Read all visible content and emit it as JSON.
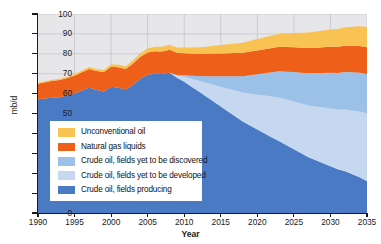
{
  "chart_data": {
    "type": "area",
    "title": "",
    "subtitle": "",
    "xlabel": "Year",
    "ylabel": "mb/d",
    "xlim": [
      1990,
      2035
    ],
    "ylim": [
      0,
      100
    ],
    "xticks": [
      1990,
      1995,
      2000,
      2005,
      2010,
      2015,
      2020,
      2025,
      2030,
      2035
    ],
    "yticks": [
      0,
      10,
      20,
      30,
      40,
      50,
      60,
      70,
      80,
      90,
      100
    ],
    "grid": true,
    "stacked": true,
    "legend_position": "lower-left",
    "x": [
      1990,
      1991,
      1992,
      1993,
      1994,
      1995,
      1996,
      1997,
      1998,
      1999,
      2000,
      2001,
      2002,
      2003,
      2004,
      2005,
      2006,
      2007,
      2008,
      2009,
      2010,
      2011,
      2012,
      2013,
      2014,
      2015,
      2016,
      2017,
      2018,
      2019,
      2020,
      2021,
      2022,
      2023,
      2024,
      2025,
      2026,
      2027,
      2028,
      2029,
      2030,
      2031,
      2032,
      2033,
      2034,
      2035
    ],
    "series": [
      {
        "name": "Crude oil, fields producing",
        "color": "#4a7ac4",
        "values": [
          57.0,
          57.5,
          58.0,
          58.2,
          59.0,
          60.0,
          61.5,
          63.0,
          61.8,
          61.0,
          63.5,
          63.0,
          62.0,
          64.5,
          67.5,
          69.5,
          70.0,
          69.8,
          70.5,
          68.0,
          66.0,
          63.5,
          61.0,
          58.5,
          56.0,
          53.5,
          51.0,
          48.5,
          46.0,
          44.0,
          42.0,
          40.0,
          38.0,
          36.0,
          34.0,
          32.0,
          30.0,
          28.0,
          26.5,
          25.0,
          23.5,
          22.0,
          21.0,
          19.5,
          18.0,
          16.0
        ]
      },
      {
        "name": "Crude oil, fields yet to be developed",
        "color": "#c6d8f0",
        "values": [
          0,
          0,
          0,
          0,
          0,
          0,
          0,
          0,
          0,
          0,
          0,
          0,
          0,
          0,
          0,
          0,
          0,
          0,
          0,
          1.0,
          2.5,
          4.0,
          5.5,
          7.0,
          8.5,
          10.0,
          11.5,
          13.0,
          14.5,
          16.0,
          17.5,
          19.0,
          20.5,
          22.0,
          23.0,
          24.0,
          25.0,
          26.0,
          27.0,
          28.0,
          29.0,
          30.0,
          31.0,
          32.0,
          33.0,
          34.0
        ]
      },
      {
        "name": "Crude oil, fields yet to be discovered",
        "color": "#9cc1e8",
        "values": [
          0,
          0,
          0,
          0,
          0,
          0,
          0,
          0,
          0,
          0,
          0,
          0,
          0,
          0,
          0,
          0,
          0,
          0,
          0,
          0.3,
          0.8,
          1.5,
          2.3,
          3.2,
          4.2,
          5.2,
          6.2,
          7.2,
          8.2,
          9.2,
          10.2,
          11.2,
          12.2,
          13.2,
          14.0,
          14.8,
          15.5,
          16.2,
          16.8,
          17.4,
          18.0,
          18.4,
          18.8,
          19.2,
          19.5,
          19.8
        ]
      },
      {
        "name": "Natural gas liquids",
        "color": "#ee5f1a",
        "values": [
          8.0,
          8.2,
          8.4,
          8.6,
          8.8,
          9.0,
          9.2,
          9.4,
          9.6,
          9.8,
          10.0,
          10.2,
          10.4,
          10.6,
          11.0,
          11.2,
          11.3,
          11.4,
          11.5,
          11.2,
          11.0,
          11.1,
          11.2,
          11.3,
          11.4,
          11.5,
          11.6,
          11.7,
          11.8,
          11.9,
          12.0,
          12.1,
          12.2,
          12.3,
          12.4,
          12.5,
          12.6,
          12.7,
          12.8,
          12.9,
          13.0,
          13.1,
          13.2,
          13.3,
          13.4,
          13.5
        ]
      },
      {
        "name": "Unconventional oil",
        "color": "#f9c354",
        "values": [
          0.5,
          0.5,
          0.6,
          0.6,
          0.7,
          0.8,
          0.9,
          1.0,
          1.0,
          1.1,
          1.2,
          1.3,
          1.4,
          1.6,
          1.8,
          2.0,
          2.2,
          2.4,
          2.6,
          2.7,
          2.9,
          3.1,
          3.3,
          3.6,
          3.9,
          4.2,
          4.5,
          4.8,
          5.1,
          5.4,
          5.7,
          6.0,
          6.3,
          6.6,
          6.9,
          7.2,
          7.5,
          7.8,
          8.1,
          8.4,
          8.7,
          9.0,
          9.3,
          9.6,
          9.9,
          10.2
        ]
      }
    ]
  },
  "axes": {
    "y_title": "mb/d",
    "x_title": "Year",
    "y_ticks": [
      "0",
      "10",
      "20",
      "30",
      "40",
      "50",
      "60",
      "70",
      "80",
      "90",
      "100"
    ],
    "x_ticks": [
      "1990",
      "1995",
      "2000",
      "2005",
      "2010",
      "2015",
      "2020",
      "2025",
      "2030",
      "2035"
    ]
  },
  "legend": {
    "items": [
      {
        "label": "Unconventional oil",
        "color": "#f9c354"
      },
      {
        "label": "Natural gas liquids",
        "color": "#ee5f1a"
      },
      {
        "label": "Crude oil, fields yet to be discovered",
        "color": "#9cc1e8"
      },
      {
        "label": "Crude oil, fields yet to be developed",
        "color": "#c6d8f0"
      },
      {
        "label": "Crude oil, fields producing",
        "color": "#4a7ac4"
      }
    ]
  },
  "style": {
    "plot_background": "#e7e7ea",
    "gridline_color": "#b9b9c4",
    "axis_color": "#1a1a1a",
    "page_background": "#ffffff"
  }
}
